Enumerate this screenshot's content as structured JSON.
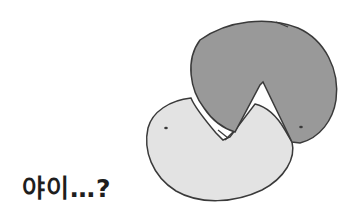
{
  "caption": "야이…?",
  "illustration": {
    "description": "Two pac-man-like rounded shapes interlocking; dark gray shape on top, light gray shape below",
    "colors": {
      "dark_shape": "#999999",
      "light_shape": "#e3e3e3",
      "outline": "#3a3a3a",
      "background": "#ffffff"
    }
  }
}
